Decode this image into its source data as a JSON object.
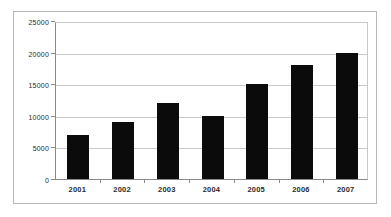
{
  "chart_data": {
    "type": "bar",
    "title": "",
    "subtitle": "",
    "xlabel": "",
    "ylabel": "",
    "categories": [
      "2001",
      "2002",
      "2003",
      "2004",
      "2005",
      "2006",
      "2007"
    ],
    "values": [
      7000,
      9000,
      12000,
      10000,
      15000,
      18000,
      20000
    ],
    "series": [
      {
        "name": "Series 1",
        "values": [
          7000,
          9000,
          12000,
          10000,
          15000,
          18000,
          20000
        ],
        "color": "#0b0b0b"
      }
    ],
    "ylim": [
      0,
      25000
    ],
    "ytick_labels": [
      "0",
      "5000",
      "10000",
      "15000",
      "20000",
      "25000"
    ],
    "ytick_values": [
      0,
      5000,
      10000,
      15000,
      20000,
      25000
    ],
    "grid": true,
    "grid_axis": "y",
    "legend": false,
    "legend_position": "none",
    "annotations": [],
    "colors": {
      "bar": "#0b0b0b",
      "gridline": "#c9c9c9",
      "axis": "#8a8a8a",
      "frame": "#b9b9b9",
      "background": "#ffffff",
      "text": "#2b2b2b"
    }
  }
}
